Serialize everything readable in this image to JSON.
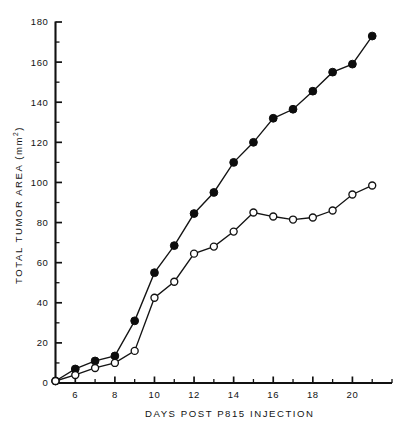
{
  "chart_data": {
    "type": "line",
    "title": "",
    "xlabel": "DAYS  POST  P815  INJECTION",
    "ylabel": "TOTAL TUMOR AREA  (mm",
    "ylabel_superscript": "2",
    "ylabel_suffix": ")",
    "xlim": [
      5,
      22
    ],
    "ylim": [
      0,
      180
    ],
    "x_tick_labels": [
      "6",
      "8",
      "10",
      "12",
      "14",
      "16",
      "18",
      "20"
    ],
    "x_tick_values": [
      6,
      8,
      10,
      12,
      14,
      16,
      18,
      20
    ],
    "x_minor_ticks": [
      5,
      7,
      9,
      11,
      13,
      15,
      17,
      19,
      21,
      22
    ],
    "y_tick_labels": [
      "0",
      "20",
      "40",
      "60",
      "80",
      "100",
      "120",
      "140",
      "160",
      "180"
    ],
    "y_tick_values": [
      0,
      20,
      40,
      60,
      80,
      100,
      120,
      140,
      160,
      180
    ],
    "y_minor_ticks": [
      10,
      30,
      50,
      70,
      90,
      110,
      130,
      150,
      170
    ],
    "grid": false,
    "legend": "none",
    "marker_colors": {
      "filled": "#0d0d0d",
      "open": "#ffffff",
      "stroke": "#121212"
    },
    "series": [
      {
        "name": "filled-circle-series",
        "marker": "filled-circle",
        "x": [
          5,
          6,
          7,
          8,
          9,
          10,
          11,
          12,
          13,
          14,
          15,
          16,
          17,
          18,
          19,
          20,
          21
        ],
        "values": [
          1,
          7,
          11,
          13.5,
          31,
          55,
          68.5,
          84.5,
          95,
          110,
          120,
          132,
          136.5,
          145.5,
          155,
          159,
          173
        ]
      },
      {
        "name": "open-circle-series",
        "marker": "open-circle",
        "x": [
          5,
          6,
          7,
          8,
          9,
          10,
          11,
          12,
          13,
          14,
          15,
          16,
          17,
          18,
          19,
          20,
          21
        ],
        "values": [
          1,
          4,
          7.5,
          10,
          16,
          42.5,
          50.5,
          64.5,
          68,
          75.5,
          85,
          83,
          81.5,
          82.5,
          86,
          94,
          98.5
        ]
      }
    ]
  }
}
